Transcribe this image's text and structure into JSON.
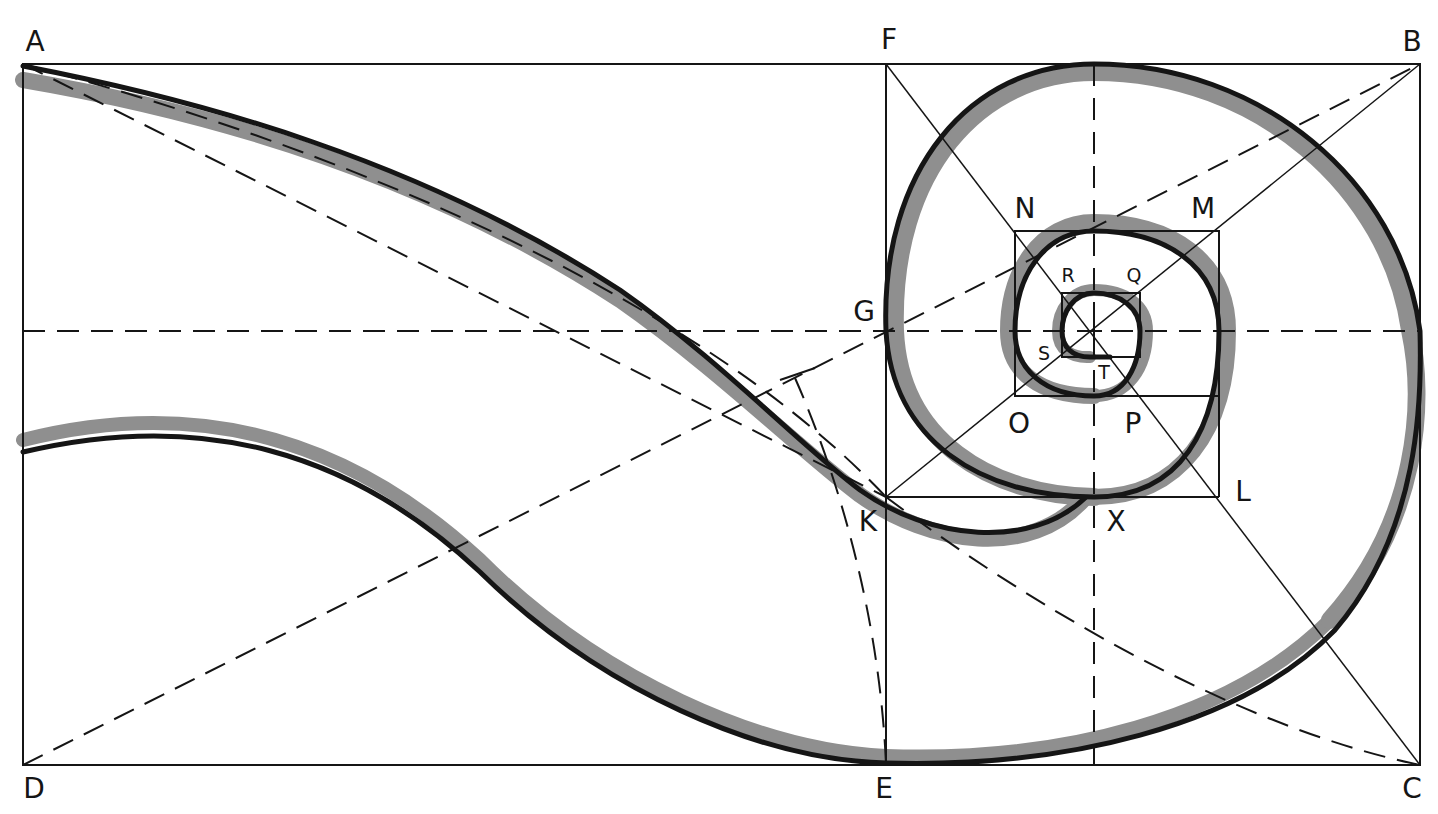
{
  "diagram": {
    "colors": {
      "ink": "#151515",
      "shade": "#8f8f8f",
      "paper": "#ffffff"
    },
    "labels": {
      "A": "A",
      "B": "B",
      "C": "C",
      "D": "D",
      "E": "E",
      "F": "F",
      "G": "G",
      "K": "K",
      "L": "L",
      "M": "M",
      "N": "N",
      "O": "O",
      "P": "P",
      "Q": "Q",
      "R": "R",
      "S": "S",
      "T": "T",
      "X": "X"
    },
    "points": {
      "A": [
        23,
        64
      ],
      "B": [
        1420,
        64
      ],
      "C": [
        1420,
        765
      ],
      "D": [
        23,
        765
      ],
      "E": [
        886,
        765
      ],
      "F": [
        886,
        64
      ],
      "G": [
        886,
        331
      ],
      "K": [
        886,
        497
      ],
      "L": [
        1219,
        497
      ],
      "M": [
        1219,
        231
      ],
      "N": [
        1015,
        231
      ],
      "O": [
        1015,
        396
      ],
      "P": [
        1140,
        396
      ],
      "Q": [
        1140,
        293
      ],
      "R": [
        1062,
        293
      ],
      "S": [
        1062,
        357
      ],
      "T": [
        1110,
        357
      ],
      "X": [
        1094,
        497
      ]
    }
  }
}
